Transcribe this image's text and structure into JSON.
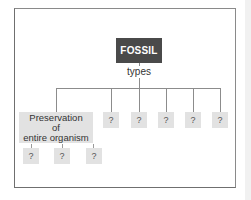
{
  "diagram": {
    "root": {
      "label": "FOSSIL",
      "fill": "#4a4a4a",
      "text_color": "#ffffff"
    },
    "edge_label": "types",
    "children": [
      {
        "label_lines": [
          "Preservation",
          "of",
          "entire organism"
        ],
        "children": [
          {
            "label": "?"
          },
          {
            "label": "?"
          },
          {
            "label": "?"
          }
        ]
      },
      {
        "label": "?"
      },
      {
        "label": "?"
      },
      {
        "label": "?"
      },
      {
        "label": "?"
      },
      {
        "label": "?"
      }
    ],
    "box_fill": "#e2e2e2",
    "line_color": "#8c8c8c"
  }
}
